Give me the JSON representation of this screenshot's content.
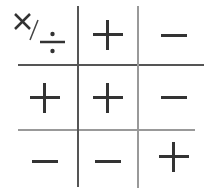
{
  "header_cell": {
    "symbols": [
      "×",
      "/",
      "÷"
    ]
  },
  "columns": [
    "+",
    "−"
  ],
  "rows": [
    {
      "header": "+",
      "cells": [
        "+",
        "−"
      ]
    },
    {
      "header": "−",
      "cells": [
        "−",
        "+"
      ]
    }
  ],
  "header_row": [
    "×/÷",
    "+",
    "−"
  ],
  "colors": {
    "line_dark": "#555555",
    "line_light": "#9a9a9a",
    "glyph": "#333333"
  }
}
